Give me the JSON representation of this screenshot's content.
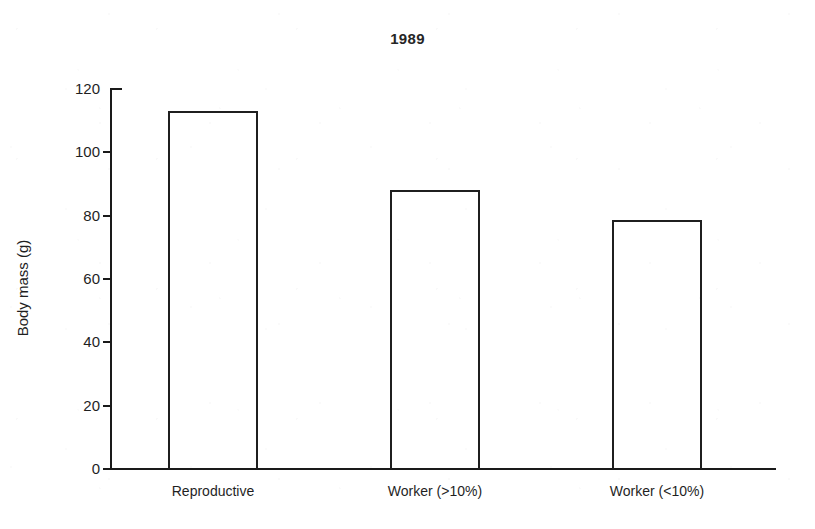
{
  "chart_data": {
    "type": "bar",
    "title": "1989",
    "xlabel": "",
    "ylabel": "Body mass (g)",
    "categories": [
      "Reproductive",
      "Worker (>10%)",
      "Worker (<10%)"
    ],
    "values": [
      113,
      88,
      78.5
    ],
    "ylim": [
      0,
      120
    ],
    "yticks": [
      0,
      20,
      40,
      60,
      80,
      100,
      120
    ],
    "ytick_labels": [
      "0",
      "20",
      "40",
      "60",
      "80",
      "100",
      "120"
    ],
    "grid": false,
    "legend": null,
    "bar_style": {
      "fill": "none",
      "edge_color": "#1f1f1f",
      "edge_width": 2
    },
    "axis_color": "#1a1a1a",
    "background_color": "#ffffff"
  }
}
